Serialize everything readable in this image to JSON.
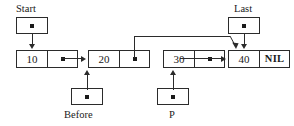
{
  "diagram": {
    "background_color": "#ffffff",
    "stroke_color": "#2b2b2b",
    "text_color": "#1a1a1a",
    "nil_label": "NIL",
    "nodes": [
      {
        "id": "node-10",
        "value": "10",
        "link_symbol": "pointer-dot",
        "tail": false
      },
      {
        "id": "node-20",
        "value": "20",
        "link_symbol": "pointer-dot",
        "tail": false
      },
      {
        "id": "node-30",
        "value": "30",
        "link_symbol": "pointer-dot",
        "tail": false
      },
      {
        "id": "node-40",
        "value": "40",
        "link_symbol": "NIL",
        "tail": true
      }
    ],
    "pointer_variables": [
      {
        "id": "start-pointer",
        "label": "Start",
        "label_position": "above",
        "targets": "node-10"
      },
      {
        "id": "last-pointer",
        "label": "Last",
        "label_position": "above",
        "targets": "node-40"
      },
      {
        "id": "before-pointer",
        "label": "Before",
        "label_position": "below",
        "targets": "node-20"
      },
      {
        "id": "p-pointer",
        "label": "P",
        "label_position": "below",
        "targets": "node-30"
      }
    ],
    "links": [
      {
        "id": "link-10-to-20",
        "from": "node-10",
        "to": "node-20",
        "style": "straight"
      },
      {
        "id": "link-20-to-40",
        "from": "node-20",
        "to": "node-40",
        "style": "elbow-over"
      },
      {
        "id": "link-30-to-40",
        "from": "node-30",
        "to": "node-40",
        "style": "straight"
      }
    ]
  }
}
